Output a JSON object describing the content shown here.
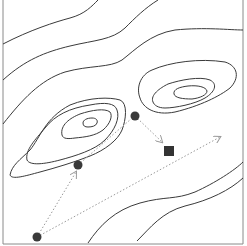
{
  "diagram": {
    "title": "",
    "colors": {
      "background": "#ffffff",
      "frame": "#8a8a8a",
      "contour": "#3a3a3a",
      "path": "#9a9a9a",
      "point": "#3a3a3a",
      "target": "#333333"
    },
    "points": [
      {
        "id": "start",
        "x": 37,
        "y": 237
      },
      {
        "id": "step-1",
        "x": 78,
        "y": 165
      },
      {
        "id": "step-2",
        "x": 135,
        "y": 116
      }
    ],
    "target": {
      "x": 169,
      "y": 151,
      "size": 10
    },
    "arrows": [
      {
        "from": "start",
        "to_x": 76,
        "to_y": 172
      },
      {
        "from": "step-1",
        "to_x": 131,
        "to_y": 119
      },
      {
        "from": "step-2",
        "to_x": 162,
        "to_y": 142
      },
      {
        "from": "start",
        "to_x": 220,
        "to_y": 137
      }
    ]
  }
}
